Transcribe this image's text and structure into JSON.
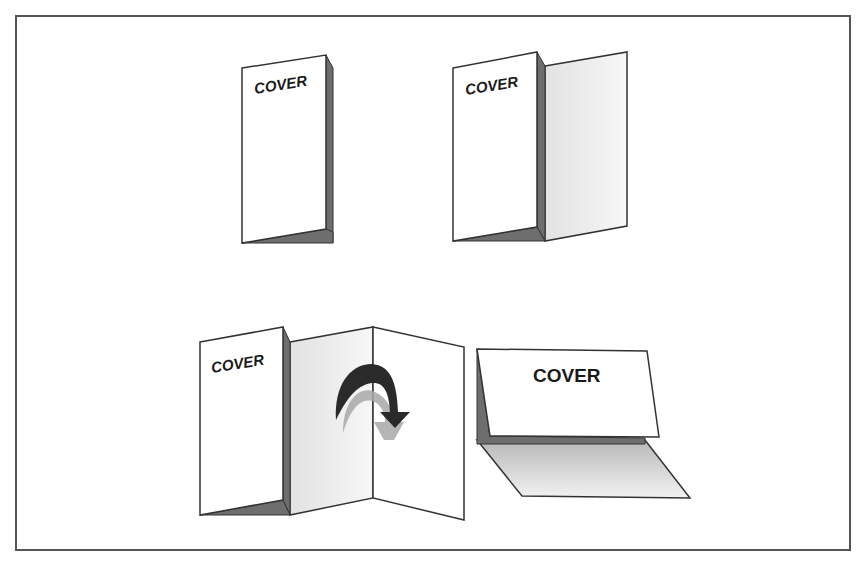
{
  "diagram": {
    "frame": {
      "border_color": "#555555",
      "background": "#ffffff"
    },
    "colors": {
      "outline": "#333333",
      "paper": "#ffffff",
      "shade_dark": "#6e6e6e",
      "shade_light": "#ededed",
      "arrow": "#2a2a2a",
      "arrow_shadow": "#9a9a9a"
    },
    "figures": [
      {
        "id": "closed-folder",
        "cover_label": "COVER",
        "description": "Closed bi-fold folder, cover facing"
      },
      {
        "id": "opened-folder",
        "cover_label": "COVER",
        "description": "Bi-fold folder partially opened"
      },
      {
        "id": "trifold-open",
        "cover_label": "COVER",
        "description": "Tri-fold with inner panel folding over, curved arrow"
      },
      {
        "id": "tent-card",
        "cover_label": "COVER",
        "description": "Tent / landscape fold"
      }
    ]
  }
}
